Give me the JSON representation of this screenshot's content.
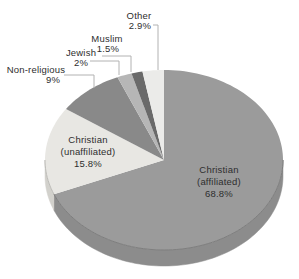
{
  "page": {
    "background": "#ffffff"
  },
  "chart_data": {
    "type": "pie",
    "title": "",
    "legend": "none",
    "effect_3d": true,
    "direction": "clockwise",
    "start_angle_deg": 0,
    "categories": [
      "Christian (affiliated)",
      "Christian (unaffiliated)",
      "Non-religious",
      "Jewish",
      "Muslim",
      "Other"
    ],
    "values": [
      68.8,
      15.8,
      9,
      2,
      1.5,
      2.9
    ],
    "slices": [
      {
        "label": "Christian (affiliated)",
        "value": 68.8,
        "display": "68.8%",
        "color": "#9b9b9b",
        "side_color": "#8c8c8c"
      },
      {
        "label": "Christian (unaffiliated)",
        "value": 15.8,
        "display": "15.8%",
        "color": "#e8e7e3",
        "side_color": "#d2d1cc"
      },
      {
        "label": "Non-religious",
        "value": 9,
        "display": "9%",
        "color": "#898989",
        "side_color": "#7b7b7b"
      },
      {
        "label": "Jewish",
        "value": 2,
        "display": "2%",
        "color": "#b6b6b6",
        "side_color": "#a4a4a4"
      },
      {
        "label": "Muslim",
        "value": 1.5,
        "display": "1.5%",
        "color": "#6a6a6a",
        "side_color": "#5f5f5f"
      },
      {
        "label": "Other",
        "value": 2.9,
        "display": "2.9%",
        "color": "#ebebe9",
        "side_color": "#d7d7d4"
      }
    ],
    "geometry": {
      "cx": 164,
      "cy": 160,
      "rx": 119,
      "ry": 90,
      "depth": 16
    },
    "leader_line_color": "#b2b2b2",
    "label_color": "#2e2e2e",
    "annotations": [
      {
        "name": "label-other",
        "lines": [
          {
            "text": "Other",
            "x": 139,
            "y": 19
          },
          {
            "text": "2.9%",
            "x": 140,
            "y": 29
          }
        ],
        "leader": [
          [
            153,
            25
          ],
          [
            158,
            25
          ],
          [
            158,
            70
          ]
        ]
      },
      {
        "name": "label-muslim",
        "lines": [
          {
            "text": "Muslim",
            "x": 107,
            "y": 42
          },
          {
            "text": "1.5%",
            "x": 108,
            "y": 52
          }
        ],
        "leader": [
          [
            102,
            56
          ],
          [
            131,
            56
          ],
          [
            131,
            72
          ]
        ]
      },
      {
        "name": "label-jewish",
        "lines": [
          {
            "text": "Jewish",
            "x": 81,
            "y": 56
          },
          {
            "text": "2%",
            "x": 81,
            "y": 66
          }
        ],
        "leader": [
          [
            90,
            61
          ],
          [
            119,
            61
          ],
          [
            119,
            75
          ]
        ]
      },
      {
        "name": "label-non-religious",
        "lines": [
          {
            "text": "Non-religious",
            "x": 36,
            "y": 73
          },
          {
            "text": "9%",
            "x": 53,
            "y": 83
          }
        ],
        "leader": [
          [
            64,
            75
          ],
          [
            94,
            75
          ],
          [
            94,
            88
          ]
        ]
      },
      {
        "name": "label-christian-unaffiliated",
        "lines": [
          {
            "text": "Christian",
            "x": 88,
            "y": 143
          },
          {
            "text": "(unaffiliated)",
            "x": 88,
            "y": 155
          },
          {
            "text": "15.8%",
            "x": 88,
            "y": 167
          }
        ]
      },
      {
        "name": "label-christian-affiliated",
        "lines": [
          {
            "text": "Christian",
            "x": 219,
            "y": 173
          },
          {
            "text": "(affiliated)",
            "x": 219,
            "y": 185
          },
          {
            "text": "68.8%",
            "x": 219,
            "y": 197
          }
        ]
      }
    ]
  }
}
